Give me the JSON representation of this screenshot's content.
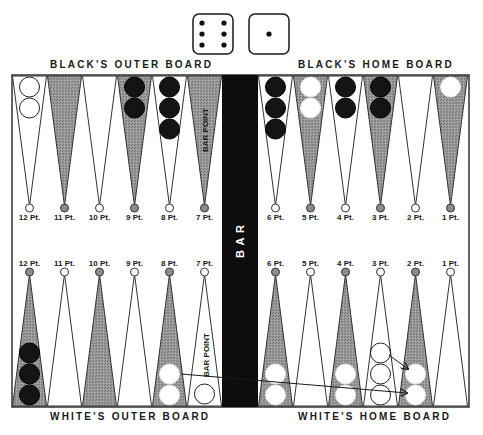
{
  "dice": [
    {
      "value": 6,
      "label": "die-six"
    },
    {
      "value": 1,
      "label": "die-one"
    }
  ],
  "labels": {
    "top_left": "BLACK'S OUTER BOARD",
    "top_right": "BLACK'S HOME BOARD",
    "bottom_left": "WHITE'S OUTER BOARD",
    "bottom_right": "WHITE'S HOME BOARD",
    "bar": "B A R",
    "bar_point_top": "BAR POINT",
    "bar_point_bottom": "BAR POINT"
  },
  "colors": {
    "shaded_point": "#8c8c8c",
    "board_border": "#333333",
    "bar": "#0d0d0d",
    "black_checker": "#141414",
    "white_checker": "#ffffff"
  },
  "top_points": [
    {
      "label": "12 Pt.",
      "shaded": false,
      "checkers": {
        "color": "white",
        "count": 2
      }
    },
    {
      "label": "11 Pt.",
      "shaded": true,
      "checkers": {
        "color": "none",
        "count": 0
      }
    },
    {
      "label": "10 Pt.",
      "shaded": false,
      "checkers": {
        "color": "none",
        "count": 0
      }
    },
    {
      "label": "9 Pt.",
      "shaded": true,
      "checkers": {
        "color": "black",
        "count": 2
      }
    },
    {
      "label": "8 Pt.",
      "shaded": false,
      "checkers": {
        "color": "black",
        "count": 3
      }
    },
    {
      "label": "7 Pt.",
      "shaded": true,
      "checkers": {
        "color": "none",
        "count": 0
      }
    },
    {
      "label": "6 Pt.",
      "shaded": false,
      "checkers": {
        "color": "black",
        "count": 3
      }
    },
    {
      "label": "5 Pt.",
      "shaded": true,
      "checkers": {
        "color": "white",
        "count": 2
      }
    },
    {
      "label": "4 Pt.",
      "shaded": false,
      "checkers": {
        "color": "black",
        "count": 2
      }
    },
    {
      "label": "3 Pt.",
      "shaded": true,
      "checkers": {
        "color": "black",
        "count": 2
      }
    },
    {
      "label": "2 Pt.",
      "shaded": false,
      "checkers": {
        "color": "none",
        "count": 0
      }
    },
    {
      "label": "1 Pt.",
      "shaded": true,
      "checkers": {
        "color": "white",
        "count": 1
      }
    }
  ],
  "bottom_points": [
    {
      "label": "12 Pt.",
      "shaded": true,
      "checkers": {
        "color": "black",
        "count": 3
      }
    },
    {
      "label": "11 Pt.",
      "shaded": false,
      "checkers": {
        "color": "none",
        "count": 0
      }
    },
    {
      "label": "10 Pt.",
      "shaded": true,
      "checkers": {
        "color": "none",
        "count": 0
      }
    },
    {
      "label": "9 Pt.",
      "shaded": false,
      "checkers": {
        "color": "none",
        "count": 0
      }
    },
    {
      "label": "8 Pt.",
      "shaded": true,
      "checkers": {
        "color": "white",
        "count": 2
      }
    },
    {
      "label": "7 Pt.",
      "shaded": false,
      "checkers": {
        "color": "white",
        "count": 1
      }
    },
    {
      "label": "6 Pt.",
      "shaded": true,
      "checkers": {
        "color": "white",
        "count": 2
      }
    },
    {
      "label": "5 Pt.",
      "shaded": false,
      "checkers": {
        "color": "none",
        "count": 0
      }
    },
    {
      "label": "4 Pt.",
      "shaded": true,
      "checkers": {
        "color": "white",
        "count": 2
      }
    },
    {
      "label": "3 Pt.",
      "shaded": false,
      "checkers": {
        "color": "white-ghost",
        "count": 3
      }
    },
    {
      "label": "2 Pt.",
      "shaded": true,
      "checkers": {
        "color": "white",
        "count": 2
      }
    },
    {
      "label": "1 Pt.",
      "shaded": false,
      "checkers": {
        "color": "none",
        "count": 0
      }
    }
  ],
  "moves": [
    {
      "from": "8 Pt. (white)",
      "to": "2 Pt. (white)",
      "arrow": true
    },
    {
      "from": "3 Pt. (white)",
      "to": "2 Pt. (white)",
      "arrow": true
    }
  ]
}
